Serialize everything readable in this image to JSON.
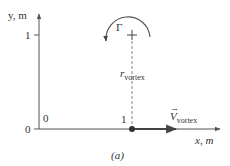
{
  "figure": {
    "panel_label": "(a)",
    "axes": {
      "x_label": "x, m",
      "y_label": "y, m",
      "x_ticks": [
        "0",
        "1"
      ],
      "y_ticks": [
        "0",
        "1"
      ],
      "origin_label": "0"
    },
    "vortex": {
      "circulation_symbol": "Γ",
      "center_marker": "+",
      "radius_label_main": "r",
      "radius_label_sub": "vortex",
      "velocity_label_main": "V",
      "velocity_label_arrow": "→",
      "velocity_label_sub": "vortex",
      "rotation": "counterclockwise"
    },
    "colors": {
      "axis": "#555555",
      "arrow": "#444444",
      "text": "#333333",
      "background": "#ffffff"
    }
  }
}
